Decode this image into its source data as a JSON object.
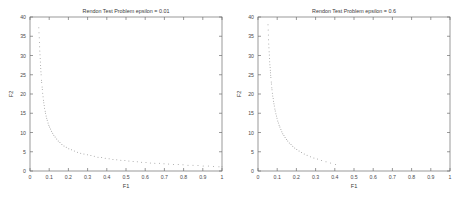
{
  "figure": {
    "background_color": "#ffffff",
    "axis_color": "#6e6e6e",
    "marker_color": "#9a9a9a",
    "text_color": "#3a3a3a"
  },
  "chart_data": [
    {
      "type": "scatter",
      "title": "Rendon Test Problem epsilon = 0.01",
      "xlabel": "F1",
      "ylabel": "F2",
      "xlim": [
        0,
        1
      ],
      "ylim": [
        0,
        40
      ],
      "grid": false,
      "legend": null,
      "xticks": [
        0,
        0.1,
        0.2,
        0.3,
        0.4,
        0.5,
        0.6,
        0.7,
        0.8,
        0.9,
        1
      ],
      "xticklabels": [
        "0",
        "0.1",
        "0.2",
        "0.3",
        "0.4",
        "0.5",
        "0.6",
        "0.7",
        "0.8",
        "0.9",
        "1"
      ],
      "yticks": [
        0,
        5,
        10,
        15,
        20,
        25,
        30,
        35,
        40
      ],
      "yticklabels": [
        "0",
        "5",
        "10",
        "15",
        "20",
        "25",
        "30",
        "35",
        "40"
      ],
      "marker": "dot",
      "x": [
        0.046,
        0.047,
        0.048,
        0.049,
        0.05,
        0.051,
        0.052,
        0.053,
        0.054,
        0.055,
        0.056,
        0.057,
        0.058,
        0.06,
        0.061,
        0.063,
        0.064,
        0.066,
        0.068,
        0.07,
        0.072,
        0.074,
        0.076,
        0.079,
        0.081,
        0.084,
        0.087,
        0.09,
        0.094,
        0.098,
        0.102,
        0.107,
        0.112,
        0.118,
        0.124,
        0.131,
        0.139,
        0.147,
        0.156,
        0.166,
        0.177,
        0.189,
        0.202,
        0.216,
        0.231,
        0.247,
        0.264,
        0.281,
        0.299,
        0.317,
        0.335,
        0.354,
        0.373,
        0.392,
        0.412,
        0.432,
        0.452,
        0.473,
        0.494,
        0.515,
        0.537,
        0.559,
        0.581,
        0.604,
        0.627,
        0.65,
        0.674,
        0.698,
        0.722,
        0.747,
        0.772,
        0.797,
        0.823,
        0.849,
        0.875,
        0.902,
        0.929,
        0.956,
        0.984,
        1.0
      ],
      "y": [
        37.2,
        35.9,
        34.6,
        33.4,
        32.3,
        31.2,
        30.2,
        29.2,
        28.3,
        27.4,
        26.6,
        25.8,
        25.0,
        23.6,
        23.0,
        21.8,
        21.2,
        20.2,
        19.3,
        18.4,
        17.7,
        17.0,
        16.3,
        15.5,
        15.0,
        14.3,
        13.7,
        13.2,
        12.5,
        11.9,
        11.4,
        10.9,
        10.3,
        9.8,
        9.3,
        8.8,
        8.3,
        7.8,
        7.4,
        6.9,
        6.5,
        6.2,
        5.8,
        5.5,
        5.2,
        4.9,
        4.6,
        4.4,
        4.2,
        4.0,
        3.8,
        3.6,
        3.5,
        3.3,
        3.2,
        3.0,
        2.9,
        2.8,
        2.7,
        2.6,
        2.5,
        2.4,
        2.3,
        2.2,
        2.1,
        2.0,
        2.0,
        1.9,
        1.8,
        1.7,
        1.7,
        1.6,
        1.5,
        1.5,
        1.4,
        1.3,
        1.3,
        1.2,
        1.1,
        1.1
      ]
    },
    {
      "type": "scatter",
      "title": "Rendon Test Problem epsilon = 0.6",
      "xlabel": "F1",
      "ylabel": "F2",
      "xlim": [
        0,
        1
      ],
      "ylim": [
        0,
        40
      ],
      "grid": false,
      "legend": null,
      "xticks": [
        0,
        0.1,
        0.2,
        0.3,
        0.4,
        0.5,
        0.6,
        0.7,
        0.8,
        0.9,
        1
      ],
      "xticklabels": [
        "0",
        "0.1",
        "0.2",
        "0.3",
        "0.4",
        "0.5",
        "0.6",
        "0.7",
        "0.8",
        "0.9",
        "1"
      ],
      "yticks": [
        0,
        5,
        10,
        15,
        20,
        25,
        30,
        35,
        40
      ],
      "yticklabels": [
        "0",
        "5",
        "10",
        "15",
        "20",
        "25",
        "30",
        "35",
        "40"
      ],
      "marker": "dot",
      "x": [
        0.052,
        0.053,
        0.054,
        0.055,
        0.056,
        0.057,
        0.058,
        0.059,
        0.06,
        0.061,
        0.062,
        0.063,
        0.064,
        0.065,
        0.066,
        0.067,
        0.069,
        0.07,
        0.072,
        0.073,
        0.075,
        0.077,
        0.079,
        0.081,
        0.083,
        0.085,
        0.088,
        0.09,
        0.093,
        0.096,
        0.099,
        0.103,
        0.106,
        0.11,
        0.114,
        0.119,
        0.124,
        0.129,
        0.135,
        0.141,
        0.148,
        0.155,
        0.163,
        0.172,
        0.181,
        0.191,
        0.202,
        0.214,
        0.227,
        0.241,
        0.256,
        0.273,
        0.291,
        0.31,
        0.331,
        0.354,
        0.378,
        0.404
      ],
      "y": [
        38.0,
        36.6,
        35.3,
        34.1,
        33.0,
        32.0,
        31.0,
        30.1,
        29.2,
        28.4,
        27.6,
        26.9,
        26.2,
        25.5,
        24.9,
        24.3,
        23.1,
        22.6,
        21.6,
        21.1,
        20.2,
        19.5,
        18.8,
        18.1,
        17.5,
        16.9,
        16.1,
        15.6,
        14.9,
        14.3,
        13.7,
        13.0,
        12.5,
        11.9,
        11.4,
        10.8,
        10.2,
        9.7,
        9.2,
        8.7,
        8.2,
        7.8,
        7.3,
        6.9,
        6.4,
        6.0,
        5.6,
        5.2,
        4.8,
        4.4,
        4.1,
        3.7,
        3.4,
        3.1,
        2.7,
        2.4,
        2.1,
        1.7
      ]
    }
  ]
}
